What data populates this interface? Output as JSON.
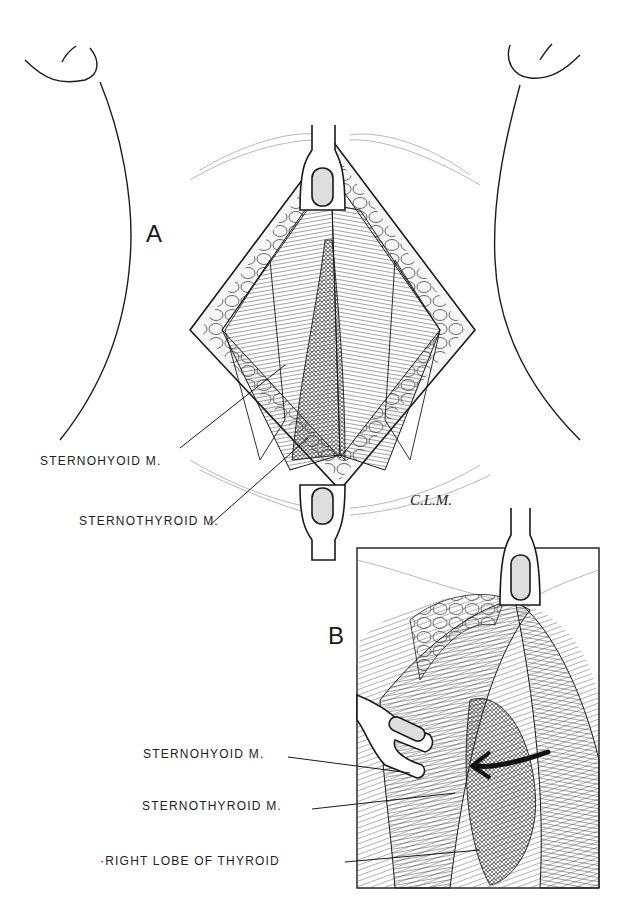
{
  "figure": {
    "panel_a": {
      "letter": "A",
      "labels": [
        {
          "text": "STERNOHYOID M."
        },
        {
          "text": "STERNOTHYROID M."
        }
      ]
    },
    "panel_b": {
      "letter": "B",
      "labels": [
        {
          "text": "STERNOHYOID M."
        },
        {
          "text": "STERNOTHYROID M."
        },
        {
          "text": "·RIGHT LOBE OF THYROID"
        }
      ]
    },
    "signature": "C.L.M.",
    "colors": {
      "ink": "#1a1a1a",
      "background": "#ffffff"
    }
  }
}
